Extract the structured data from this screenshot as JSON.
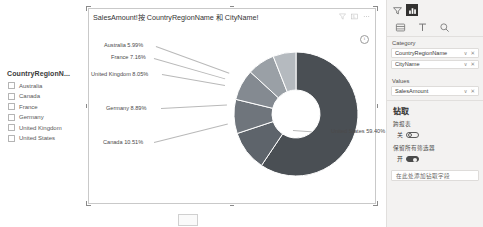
{
  "slicer": {
    "title": "CountryRegionN...",
    "items": [
      {
        "label": "Australia",
        "checked": false
      },
      {
        "label": "Canada",
        "checked": false
      },
      {
        "label": "France",
        "checked": false
      },
      {
        "label": "Germany",
        "checked": false
      },
      {
        "label": "United Kingdom",
        "checked": false
      },
      {
        "label": "United States",
        "checked": false
      }
    ]
  },
  "visual": {
    "title": "SalesAmount!按 CountryRegionName 和 CityName!",
    "icons": [
      "filter-icon",
      "focus-mode-icon",
      "more-options-icon"
    ],
    "info_glyph": "i"
  },
  "chart_data": {
    "type": "pie",
    "title": "SalesAmount!按 CountryRegionName 和 CityName!",
    "categories": [
      "United States",
      "Canada",
      "Germany",
      "United Kingdom",
      "France",
      "Australia"
    ],
    "values": [
      59.4,
      10.51,
      8.89,
      8.05,
      7.16,
      5.99
    ],
    "unit": "%",
    "labels": [
      "United States 59.40%",
      "Canada 10.51%",
      "Germany 8.89%",
      "United Kingdom 8.05%",
      "France 7.16%",
      "Australia 5.99%"
    ],
    "colors": [
      "#4a4f54",
      "#5e646b",
      "#6f757c",
      "#848a91",
      "#9aa0a6",
      "#b5babf"
    ],
    "donut": true,
    "legend": "none",
    "grid": false
  },
  "pane": {
    "tabs": [
      "filters-tab",
      "visualizations-tab"
    ],
    "viz_icons": [
      "fields-icon",
      "format-icon",
      "analytics-icon"
    ],
    "category_label": "Category",
    "category_fields": [
      {
        "name": "CountryRegionName",
        "chevron": "∨",
        "remove": "✕"
      },
      {
        "name": "CityName",
        "chevron": "∨",
        "remove": "✕"
      }
    ],
    "values_label": "Values",
    "values_fields": [
      {
        "name": "SalesAmount",
        "chevron": "∨",
        "remove": "✕"
      }
    ],
    "drill_heading": "钻取",
    "cross_report_label": "跨报表",
    "cross_report_state": "关",
    "keep_filters_label": "保留所有筛选器",
    "keep_filters_state": "开",
    "drop_zone": "在此处添加钻取字段"
  }
}
